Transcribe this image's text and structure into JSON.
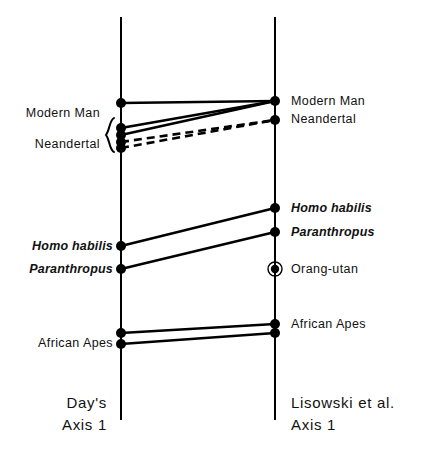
{
  "figure": {
    "title": "",
    "background": "#ffffff",
    "ink_color": "#000000"
  },
  "axes": [
    {
      "id": "left",
      "name_line1": "Day's",
      "name_line2": "Axis 1"
    },
    {
      "id": "right",
      "name_line1": "Lisowski et al.",
      "name_line2": "Axis 1"
    }
  ],
  "left_labels": {
    "modern_man": "Modern Man",
    "neandertal": "Neandertal",
    "homo_habilis": "Homo habilis",
    "paranthropus": "Paranthropus",
    "african_apes": "African Apes"
  },
  "right_labels": {
    "modern_man": "Modern Man",
    "neandertal": "Neandertal",
    "homo_habilis": "Homo habilis",
    "paranthropus": "Paranthropus",
    "orang_utan": "Orang-utan",
    "african_apes": "African Apes"
  },
  "chart_data": {
    "type": "scatter",
    "title": "",
    "xlabel": "",
    "ylabel": "",
    "grid": false,
    "legend": "none",
    "axis_geometry": {
      "left_axis_x": 121,
      "right_axis_x": 275,
      "axis_top_y": 17,
      "axis_bottom_y": 420,
      "axis_stroke_width": 2
    },
    "axis_titles": [
      {
        "axis": "left",
        "lines": [
          "Day's",
          "Axis 1"
        ]
      },
      {
        "axis": "right",
        "lines": [
          "Lisowski et al.",
          "Axis 1"
        ]
      }
    ],
    "points": [
      {
        "axis": "left",
        "id": "L1",
        "label": "Modern Man",
        "y": 103,
        "marker": "filled-dot",
        "label_side": "left",
        "label_style": "roman",
        "label_visible": true
      },
      {
        "axis": "left",
        "id": "L2",
        "label": "",
        "y": 128,
        "marker": "filled-dot",
        "label_side": "none",
        "label_style": "roman",
        "label_visible": false
      },
      {
        "axis": "left",
        "id": "L3",
        "label": "",
        "y": 135,
        "marker": "filled-dot",
        "label_side": "none",
        "label_style": "roman",
        "label_visible": false
      },
      {
        "axis": "left",
        "id": "L4",
        "label": "Neandertal",
        "y": 142,
        "marker": "filled-dot",
        "label_side": "left",
        "label_style": "roman",
        "label_visible": true
      },
      {
        "axis": "left",
        "id": "L5",
        "label": "",
        "y": 148,
        "marker": "filled-dot",
        "label_side": "none",
        "label_style": "roman",
        "label_visible": false
      },
      {
        "axis": "left",
        "id": "L6",
        "label": "Homo habilis",
        "y": 246,
        "marker": "filled-dot",
        "label_side": "left",
        "label_style": "italic",
        "label_visible": true
      },
      {
        "axis": "left",
        "id": "L7",
        "label": "Paranthropus",
        "y": 269,
        "marker": "filled-dot",
        "label_side": "left",
        "label_style": "italic",
        "label_visible": true
      },
      {
        "axis": "left",
        "id": "L8",
        "label": "African Apes",
        "y": 333,
        "marker": "filled-dot",
        "label_side": "left",
        "label_style": "roman",
        "label_visible": false
      },
      {
        "axis": "left",
        "id": "L9",
        "label": "African Apes",
        "y": 344,
        "marker": "filled-dot",
        "label_side": "left",
        "label_style": "roman",
        "label_visible": true
      },
      {
        "axis": "right",
        "id": "R1",
        "label": "Modern Man",
        "y": 101,
        "marker": "filled-dot",
        "label_side": "right",
        "label_style": "roman",
        "label_visible": true
      },
      {
        "axis": "right",
        "id": "R2",
        "label": "Neandertal",
        "y": 120,
        "marker": "filled-dot",
        "label_side": "right",
        "label_style": "roman",
        "label_visible": true
      },
      {
        "axis": "right",
        "id": "R3",
        "label": "Homo habilis",
        "y": 208,
        "marker": "filled-dot",
        "label_side": "right",
        "label_style": "italic",
        "label_visible": true
      },
      {
        "axis": "right",
        "id": "R4",
        "label": "Paranthropus",
        "y": 232,
        "marker": "filled-dot",
        "label_side": "right",
        "label_style": "italic",
        "label_visible": true
      },
      {
        "axis": "right",
        "id": "R5",
        "label": "Orang-utan",
        "y": 269,
        "marker": "circled-dot",
        "label_side": "right",
        "label_style": "roman",
        "label_visible": true
      },
      {
        "axis": "right",
        "id": "R6",
        "label": "African Apes",
        "y": 324,
        "marker": "filled-dot",
        "label_side": "right",
        "label_style": "roman",
        "label_visible": true
      },
      {
        "axis": "right",
        "id": "R7",
        "label": "",
        "y": 333,
        "marker": "filled-dot",
        "label_side": "none",
        "label_style": "roman",
        "label_visible": false
      }
    ],
    "connectors": [
      {
        "from": "L1",
        "to": "R1",
        "style": "solid"
      },
      {
        "from": "L2",
        "to": "R1",
        "style": "solid"
      },
      {
        "from": "L3",
        "to": "R1",
        "style": "solid"
      },
      {
        "from": "L4",
        "to": "R2",
        "style": "dashed"
      },
      {
        "from": "L5",
        "to": "R2",
        "style": "dashed"
      },
      {
        "from": "L6",
        "to": "R3",
        "style": "solid"
      },
      {
        "from": "L7",
        "to": "R4",
        "style": "solid"
      },
      {
        "from": "L8",
        "to": "R6",
        "style": "solid"
      },
      {
        "from": "L9",
        "to": "R7",
        "style": "solid"
      }
    ],
    "brace": {
      "axis": "left",
      "y_top": 118,
      "y_bottom": 152,
      "groups": [
        "Modern Man",
        "Neandertal"
      ]
    }
  }
}
